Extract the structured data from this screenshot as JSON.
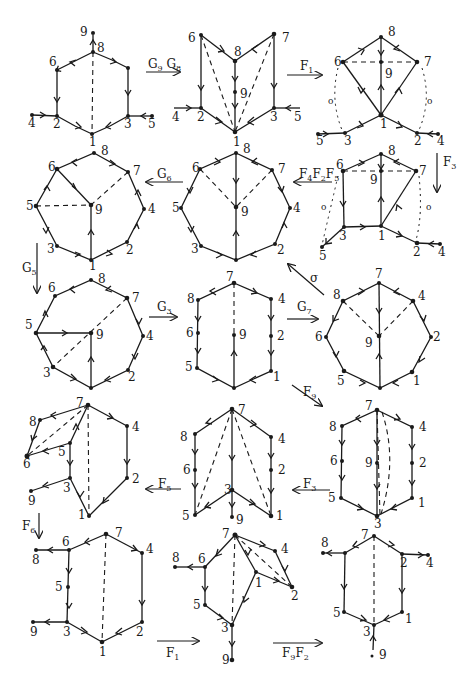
{
  "figure": {
    "ink_color": "#1a1a1a",
    "paper_color": "#ffffff",
    "graphs": [
      {
        "id": "g1",
        "shape": "hexagon",
        "vertices": [
          "9",
          "8",
          "6",
          "2",
          "4",
          "1",
          "3",
          "5"
        ],
        "dashed": [
          [
            "8",
            "1"
          ]
        ]
      },
      {
        "id": "g2",
        "shape": "folded",
        "vertices": [
          "6",
          "8",
          "7",
          "9",
          "4",
          "2",
          "1",
          "3",
          "5"
        ],
        "dashed": [
          [
            "6",
            "1"
          ],
          [
            "7",
            "1"
          ]
        ]
      },
      {
        "id": "g3",
        "shape": "kite",
        "vertices": [
          "8",
          "6",
          "9",
          "7",
          "5",
          "3",
          "1",
          "2",
          "4"
        ],
        "dashed": [
          [
            "6",
            "7"
          ]
        ],
        "dotted_labels": [
          "o",
          "o"
        ]
      },
      {
        "id": "g4",
        "shape": "octagon",
        "vertices": [
          "8",
          "6",
          "7",
          "5",
          "9",
          "4",
          "3",
          "2",
          "1"
        ],
        "dashed": [
          [
            "5",
            "9"
          ],
          [
            "7",
            "9"
          ]
        ]
      },
      {
        "id": "g5",
        "shape": "octagon",
        "vertices": [
          "8",
          "6",
          "7",
          "5",
          "9",
          "4",
          "3",
          "2",
          "1"
        ],
        "dashed": [
          [
            "6",
            "9"
          ],
          [
            "7",
            "9"
          ]
        ]
      },
      {
        "id": "g6",
        "shape": "pentagon",
        "vertices": [
          "8",
          "6",
          "9",
          "7",
          "3",
          "1",
          "2",
          "4",
          "5"
        ],
        "dashed": [
          [
            "6",
            "7"
          ]
        ],
        "dotted_labels": [
          "o",
          "o"
        ]
      },
      {
        "id": "g7",
        "shape": "octagon",
        "vertices": [
          "8",
          "6",
          "7",
          "5",
          "9",
          "4",
          "3",
          "2",
          "1"
        ],
        "dashed": [
          [
            "7",
            "3"
          ]
        ]
      },
      {
        "id": "g8",
        "shape": "hexagon",
        "vertices": [
          "7",
          "8",
          "4",
          "6",
          "9",
          "2",
          "5",
          "1",
          "3"
        ],
        "dashed": [
          [
            "7",
            "9"
          ]
        ]
      },
      {
        "id": "g9",
        "shape": "octagon",
        "vertices": [
          "7",
          "8",
          "4",
          "6",
          "9",
          "2",
          "5",
          "1",
          "3"
        ],
        "dashed": [
          [
            "8",
            "9"
          ],
          [
            "4",
            "9"
          ]
        ]
      },
      {
        "id": "g10",
        "shape": "folded",
        "vertices": [
          "7",
          "8",
          "4",
          "6",
          "5",
          "9",
          "3",
          "2",
          "1"
        ],
        "dashed": [
          [
            "7",
            "6"
          ],
          [
            "7",
            "1"
          ]
        ]
      },
      {
        "id": "g11",
        "shape": "folded",
        "vertices": [
          "7",
          "8",
          "4",
          "6",
          "2",
          "3",
          "5",
          "9",
          "1"
        ],
        "dashed": [
          [
            "7",
            "5"
          ],
          [
            "7",
            "1"
          ]
        ]
      },
      {
        "id": "g12",
        "shape": "hexagon",
        "vertices": [
          "7",
          "8",
          "4",
          "6",
          "9",
          "2",
          "5",
          "1",
          "3"
        ],
        "dashed": [
          [
            "7",
            "3"
          ]
        ]
      },
      {
        "id": "g13",
        "shape": "hexagon",
        "vertices": [
          "7",
          "6",
          "8",
          "4",
          "5",
          "2",
          "9",
          "3",
          "1"
        ],
        "dashed": [
          [
            "7",
            "1"
          ]
        ]
      },
      {
        "id": "g14",
        "shape": "folded",
        "vertices": [
          "7",
          "4",
          "8",
          "6",
          "1",
          "2",
          "5",
          "3",
          "9"
        ],
        "dashed": [
          [
            "7",
            "3"
          ],
          [
            "7",
            "2"
          ]
        ]
      },
      {
        "id": "g15",
        "shape": "hexagon",
        "vertices": [
          "7",
          "8",
          "2",
          "4",
          "5",
          "1",
          "3",
          "9"
        ],
        "dashed": [
          [
            "7",
            "3"
          ]
        ]
      }
    ],
    "operators": [
      {
        "id": "op1",
        "label": "G",
        "sub": "9",
        "label2": "G",
        "sub2": "8",
        "direction": "right"
      },
      {
        "id": "op2",
        "label": "F",
        "sub": "1",
        "direction": "right"
      },
      {
        "id": "op3",
        "label": "F",
        "sub": "3",
        "direction": "down"
      },
      {
        "id": "op4",
        "label": "F",
        "sub": "4",
        "label2": "F",
        "sub2": "2",
        "label3": "F",
        "sub3": "5",
        "direction": "left"
      },
      {
        "id": "op5",
        "label": "G",
        "sub": "6",
        "direction": "left"
      },
      {
        "id": "op6",
        "label": "G",
        "sub": "5",
        "direction": "down"
      },
      {
        "id": "op7",
        "label": "σ",
        "direction": "up-left"
      },
      {
        "id": "op8",
        "label": "G",
        "sub": "3",
        "direction": "right"
      },
      {
        "id": "op9",
        "label": "G",
        "sub": "7",
        "direction": "right"
      },
      {
        "id": "op10",
        "label": "F",
        "sub": "9",
        "direction": "down-right"
      },
      {
        "id": "op11",
        "label": "F",
        "sub": "3",
        "direction": "left"
      },
      {
        "id": "op12",
        "label": "F",
        "sub": "5",
        "direction": "left"
      },
      {
        "id": "op13",
        "label": "F",
        "sub": "6",
        "direction": "down"
      },
      {
        "id": "op14",
        "label": "F",
        "sub": "1",
        "direction": "right"
      },
      {
        "id": "op15",
        "label": "F",
        "sub": "9",
        "label2": "F",
        "sub2": "2",
        "direction": "right"
      }
    ]
  }
}
